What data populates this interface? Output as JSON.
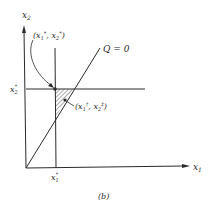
{
  "figure": {
    "caption": "(b)",
    "axes": {
      "x_label": "x",
      "x_sub": "1",
      "y_label": "x",
      "y_sub": "2"
    },
    "curve_label": "Q = 0",
    "points": {
      "star": {
        "label_open": "(x",
        "label_sub1": "1",
        "label_sup1": "*",
        "label_mid": ", x",
        "label_sub2": "2",
        "label_sup2": "*",
        "label_close": ")"
      },
      "dagger": {
        "label_open": "(x",
        "label_sub1": "1",
        "label_sup1": "†",
        "label_mid": ", x",
        "label_sub2": "2",
        "label_sup2": "‡",
        "label_close": ")"
      }
    },
    "ticks": {
      "x_star": {
        "base": "x",
        "sub": "1",
        "sup": "*"
      },
      "y_star": {
        "base": "x",
        "sub": "2",
        "sup": "*"
      }
    },
    "colors": {
      "ink": "#2a2a2a",
      "background": "#ffffff"
    }
  }
}
